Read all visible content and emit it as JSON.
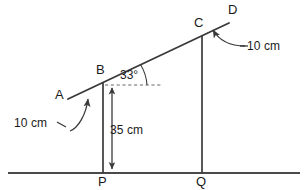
{
  "diagram": {
    "background_color": "#ffffff",
    "stroke_color": "#3a3a3a",
    "text_color": "#1a1a1a",
    "points": [
      {
        "id": "A",
        "label": "A",
        "x": 68,
        "y": 99
      },
      {
        "id": "B",
        "label": "B",
        "x": 103,
        "y": 83
      },
      {
        "id": "C",
        "label": "C",
        "x": 202,
        "y": 36
      },
      {
        "id": "D",
        "label": "D",
        "x": 229,
        "y": 23
      },
      {
        "id": "P",
        "label": "P",
        "x": 103,
        "y": 173
      },
      {
        "id": "Q",
        "label": "Q",
        "x": 202,
        "y": 173
      }
    ],
    "point_labels": [
      {
        "text": "A",
        "left": 55,
        "top": 88
      },
      {
        "text": "B",
        "left": 96,
        "top": 63
      },
      {
        "text": "C",
        "left": 194,
        "top": 16
      },
      {
        "text": "D",
        "left": 228,
        "top": 3
      },
      {
        "text": "P",
        "left": 98,
        "top": 175
      },
      {
        "text": "Q",
        "left": 196,
        "top": 175
      }
    ],
    "segments": [
      {
        "name": "incline-ad",
        "x1": 68,
        "y1": 99,
        "x2": 229,
        "y2": 23
      },
      {
        "name": "vertical-bp",
        "x1": 103,
        "y1": 83,
        "x2": 103,
        "y2": 173
      },
      {
        "name": "vertical-cq",
        "x1": 202,
        "y1": 36,
        "x2": 202,
        "y2": 173
      },
      {
        "name": "ground-line",
        "x1": 8,
        "y1": 173,
        "x2": 300,
        "y2": 173
      }
    ],
    "dashed_reference": {
      "name": "horizontal-from-b",
      "x1": 105,
      "y1": 85,
      "x2": 163,
      "y2": 85
    },
    "angle": {
      "label": "33°",
      "value": 33,
      "unit": "degrees",
      "vertex": "B",
      "label_left": 120,
      "label_top": 69
    },
    "dimensions": [
      {
        "name": "segment-ab-length",
        "label": "10 cm",
        "value": 10,
        "unit": "cm",
        "refers_to": "AB",
        "label_left": 14,
        "label_top": 117
      },
      {
        "name": "segment-cd-length",
        "label": "10 cm",
        "value": 10,
        "unit": "cm",
        "refers_to": "CD",
        "label_left": 247,
        "label_top": 40
      },
      {
        "name": "height-bp",
        "label": "35 cm",
        "value": 35,
        "unit": "cm",
        "refers_to": "BP",
        "label_left": 110,
        "label_top": 124
      }
    ]
  }
}
